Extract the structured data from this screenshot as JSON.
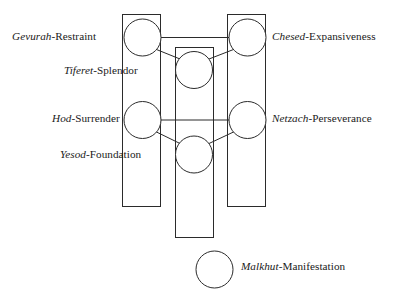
{
  "diagram": {
    "stroke_color": "#2b2b2b",
    "background_color": "#ffffff",
    "node_fill": "#ffffff",
    "nodes": [
      {
        "id": "gevurah",
        "hebrew": "Gevurah",
        "separator": "-",
        "english": "Restraint",
        "pillar": "left",
        "cx": 142.5,
        "cy": 37.5,
        "r": 18.5
      },
      {
        "id": "chesed",
        "hebrew": "Chesed",
        "separator": "-",
        "english": "Expansiveness",
        "pillar": "right",
        "cx": 247.5,
        "cy": 37.5,
        "r": 18.5
      },
      {
        "id": "tiferet",
        "hebrew": "Tiferet",
        "separator": "-",
        "english": "Splendor",
        "pillar": "center",
        "cx": 194,
        "cy": 70,
        "r": 18.5
      },
      {
        "id": "hod",
        "hebrew": "Hod",
        "separator": "-",
        "english": "Surrender",
        "pillar": "left",
        "cx": 142.5,
        "cy": 120,
        "r": 18.5
      },
      {
        "id": "netzach",
        "hebrew": "Netzach",
        "separator": "-",
        "english": "Perseverance",
        "pillar": "right",
        "cx": 247.5,
        "cy": 120,
        "r": 18.5
      },
      {
        "id": "yesod",
        "hebrew": "Yesod",
        "separator": "-",
        "english": "Foundation",
        "pillar": "center",
        "cx": 194,
        "cy": 154.5,
        "r": 18.5
      },
      {
        "id": "malkhut",
        "hebrew": "Malkhut",
        "separator": "-",
        "english": "Manifestation",
        "pillar": "center",
        "cx": 214.5,
        "cy": 269.5,
        "r": 18.5
      }
    ],
    "pillars": [
      {
        "id": "left-pillar",
        "x": 122,
        "y": 14,
        "width": 39,
        "height": 193
      },
      {
        "id": "center-pillar",
        "x": 175,
        "y": 47,
        "width": 39,
        "height": 191
      },
      {
        "id": "right-pillar",
        "x": 227,
        "y": 14,
        "width": 39,
        "height": 193
      }
    ],
    "connectors": [
      {
        "id": "gevurah-chesed",
        "type": "horizontal",
        "x1": 161,
        "y1": 37.5,
        "x2": 229,
        "y2": 37.5
      },
      {
        "id": "gevurah-tiferet",
        "type": "diagonal",
        "x1": 157,
        "y1": 50,
        "x2": 181,
        "y2": 58
      },
      {
        "id": "chesed-tiferet",
        "type": "diagonal",
        "x1": 233,
        "y1": 50,
        "x2": 208,
        "y2": 58
      },
      {
        "id": "hod-netzach",
        "type": "horizontal",
        "x1": 161,
        "y1": 120,
        "x2": 229,
        "y2": 120
      },
      {
        "id": "hod-yesod",
        "type": "diagonal",
        "x1": 157,
        "y1": 133,
        "x2": 181,
        "y2": 143
      },
      {
        "id": "netzach-yesod",
        "type": "diagonal",
        "x1": 233,
        "y1": 133,
        "x2": 208,
        "y2": 143
      }
    ]
  }
}
